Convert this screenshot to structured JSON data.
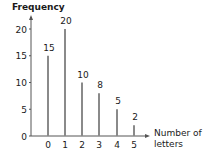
{
  "chart_data": {
    "type": "bar",
    "title": "",
    "xlabel": "Number of letters",
    "xlabel_lines": [
      "Number of",
      "letters"
    ],
    "ylabel": "Frequency",
    "categories": [
      "0",
      "1",
      "2",
      "3",
      "4",
      "5"
    ],
    "values": [
      15,
      20,
      10,
      8,
      5,
      2
    ],
    "data_labels": [
      "15",
      "20",
      "10",
      "8",
      "5",
      "2"
    ],
    "yticks": [
      0,
      5,
      10,
      15,
      20
    ],
    "ylim": [
      0,
      21
    ],
    "grid": false,
    "legend": null,
    "style": "vertical line bars with value labels above"
  },
  "colors": {
    "bar": "#8a8a8a",
    "axis": "#555555",
    "text": "#1a1a1a"
  }
}
